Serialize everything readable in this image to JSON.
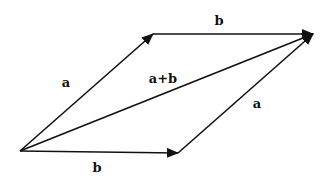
{
  "diagram": {
    "color": "#111111",
    "points": {
      "origin": [
        20,
        151
      ],
      "a_tip": [
        153,
        34
      ],
      "b_tip": [
        178,
        153
      ],
      "sum_tip": [
        313,
        34
      ]
    },
    "vectors": [
      {
        "name": "a",
        "from": "origin",
        "to": "a_tip"
      },
      {
        "name": "b",
        "from": "a_tip",
        "to": "sum_tip"
      },
      {
        "name": "a+b",
        "from": "origin",
        "to": "sum_tip"
      },
      {
        "name": "b",
        "from": "origin",
        "to": "b_tip"
      },
      {
        "name": "a",
        "from": "b_tip",
        "to": "sum_tip"
      }
    ],
    "labels": {
      "a_left": "a",
      "b_top": "b",
      "sum": "a+b",
      "a_right": "a",
      "b_bottom": "b"
    }
  }
}
